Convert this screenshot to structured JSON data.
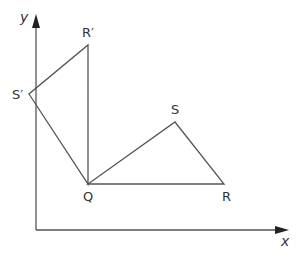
{
  "diagram": {
    "type": "coordinate-geometry-rotation",
    "axes": {
      "x_label": "x",
      "y_label": "y",
      "origin_px": [
        36,
        230
      ],
      "x_end_px": [
        288,
        230
      ],
      "y_end_px": [
        36,
        15
      ]
    },
    "points": {
      "Q": {
        "label": "Q",
        "px": [
          88,
          184
        ]
      },
      "R": {
        "label": "R",
        "px": [
          224,
          184
        ]
      },
      "S": {
        "label": "S",
        "px": [
          175,
          122
        ]
      },
      "R_prime": {
        "label": "R′",
        "px": [
          88,
          45
        ]
      },
      "S_prime": {
        "label": "S′",
        "px": [
          29,
          94
        ]
      }
    },
    "triangles": [
      {
        "name": "QRS",
        "vertices": [
          "Q",
          "R",
          "S"
        ]
      },
      {
        "name": "QR′S′",
        "vertices": [
          "Q",
          "R_prime",
          "S_prime"
        ]
      }
    ],
    "colors": {
      "line": "#555555",
      "text": "#333333",
      "background": "#ffffff"
    }
  }
}
